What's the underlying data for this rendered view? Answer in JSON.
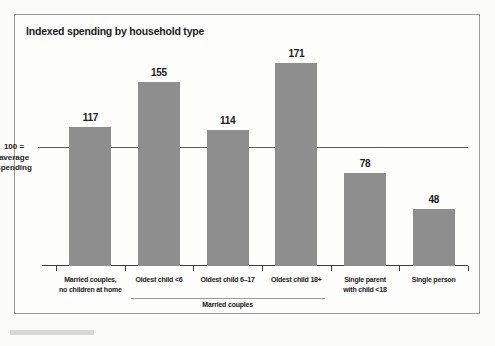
{
  "chart_data": {
    "type": "bar",
    "title": "Indexed spending by household type",
    "xlabel": "",
    "ylabel": "",
    "ylim": [
      0,
      190
    ],
    "grid": false,
    "legend": null,
    "reference_line": {
      "value": 100,
      "label_lines": [
        "100 =",
        "average",
        "spending"
      ]
    },
    "categories": [
      "Married couples,\nno children at home",
      "Oldest child <6",
      "Oldest child 6–17",
      "Oldest child 18+",
      "Single parent\nwith child <18",
      "Single person"
    ],
    "values": [
      117,
      155,
      114,
      171,
      78,
      48
    ],
    "groups": [
      {
        "label": "Married couples",
        "from_index": 1,
        "to_index": 3
      }
    ],
    "bar_color": "#8e8e8e",
    "axis_color": "#3d3d3d"
  },
  "bars": [
    {
      "label_line1": "Married couples,",
      "label_line2": "no children at home",
      "value": "117"
    },
    {
      "label_line1": "Oldest child <6",
      "label_line2": "",
      "value": "155"
    },
    {
      "label_line1": "Oldest child 6–17",
      "label_line2": "",
      "value": "114"
    },
    {
      "label_line1": "Oldest child 18+",
      "label_line2": "",
      "value": "171"
    },
    {
      "label_line1": "Single parent",
      "label_line2": "with child <18",
      "value": "78"
    },
    {
      "label_line1": "Single person",
      "label_line2": "",
      "value": "48"
    }
  ],
  "reference": {
    "line1": "100 =",
    "line2": "average",
    "line3": "spending"
  },
  "group": {
    "married_couples": "Married couples"
  }
}
